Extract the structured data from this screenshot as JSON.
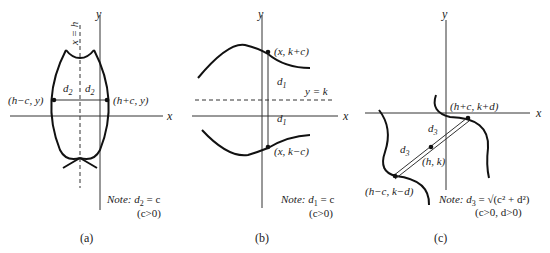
{
  "figure": {
    "panels": [
      {
        "id": "a",
        "caption": "(a)",
        "axes": {
          "x": "x",
          "y": "y"
        },
        "line_label": "x = h",
        "points": [
          "(h−c, y)",
          "(h+c, y)"
        ],
        "distance_labels": [
          "d",
          "d"
        ],
        "distance_sub": "2",
        "note_prefix": "Note:",
        "note_expr": "d",
        "note_sub": "2",
        "note_rhs": " = c",
        "condition": "(c>0)"
      },
      {
        "id": "b",
        "caption": "(b)",
        "axes": {
          "x": "x",
          "y": "y"
        },
        "line_label": "y = k",
        "points": [
          "(x, k+c)",
          "(x, k−c)"
        ],
        "distance_labels": [
          "d",
          "d"
        ],
        "distance_sub": "1",
        "note_prefix": "Note:",
        "note_expr": "d",
        "note_sub": "1",
        "note_rhs": " = c",
        "condition": "(c>0)"
      },
      {
        "id": "c",
        "caption": "(c)",
        "axes": {
          "x": "x",
          "y": "y"
        },
        "points": [
          "(h+c, k+d)",
          "(h, k)",
          "(h−c, k−d)"
        ],
        "distance_labels": [
          "d",
          "d"
        ],
        "distance_sub": "3",
        "note_prefix": "Note:",
        "note_expr": "d",
        "note_sub": "3",
        "note_rhs": " = √(c² + d²)",
        "condition": "(c>0, d>0)"
      }
    ]
  }
}
